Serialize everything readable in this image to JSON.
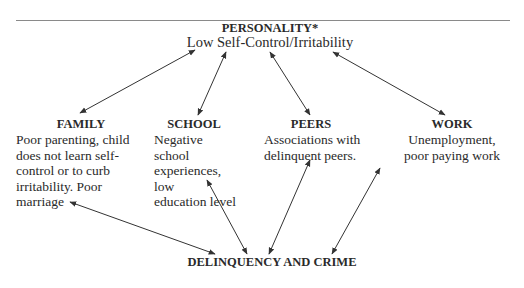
{
  "diagram": {
    "top": {
      "title": "PERSONALITY*",
      "subtitle": "Low Self-Control/Irritability"
    },
    "factors": [
      {
        "label": "FAMILY",
        "lines": [
          "Poor parenting, child",
          "does not learn self-",
          "control or  to curb",
          "irritability. Poor",
          "marriage"
        ]
      },
      {
        "label": "SCHOOL",
        "lines": [
          "Negative school",
          "experiences, low",
          "education level"
        ]
      },
      {
        "label": "PEERS",
        "lines": [
          "Associations with",
          "delinquent peers."
        ]
      },
      {
        "label": "WORK",
        "lines": [
          "Unemployment,",
          "poor paying work"
        ]
      }
    ],
    "bottom": {
      "title": "DELINQUENCY AND CRIME"
    },
    "edges": [
      {
        "from": "PERSONALITY",
        "to": "FAMILY",
        "type": "bidirectional"
      },
      {
        "from": "PERSONALITY",
        "to": "SCHOOL",
        "type": "bidirectional"
      },
      {
        "from": "PERSONALITY",
        "to": "PEERS",
        "type": "bidirectional"
      },
      {
        "from": "PERSONALITY",
        "to": "WORK",
        "type": "bidirectional"
      },
      {
        "from": "FAMILY",
        "to": "DELINQUENCY AND CRIME",
        "type": "bidirectional"
      },
      {
        "from": "SCHOOL",
        "to": "DELINQUENCY AND CRIME",
        "type": "bidirectional"
      },
      {
        "from": "PEERS",
        "to": "DELINQUENCY AND CRIME",
        "type": "bidirectional"
      },
      {
        "from": "WORK",
        "to": "DELINQUENCY AND CRIME",
        "type": "bidirectional"
      }
    ],
    "colors": {
      "line": "#333333",
      "text": "#2a2a2a",
      "rule": "#8a8a8a"
    }
  }
}
